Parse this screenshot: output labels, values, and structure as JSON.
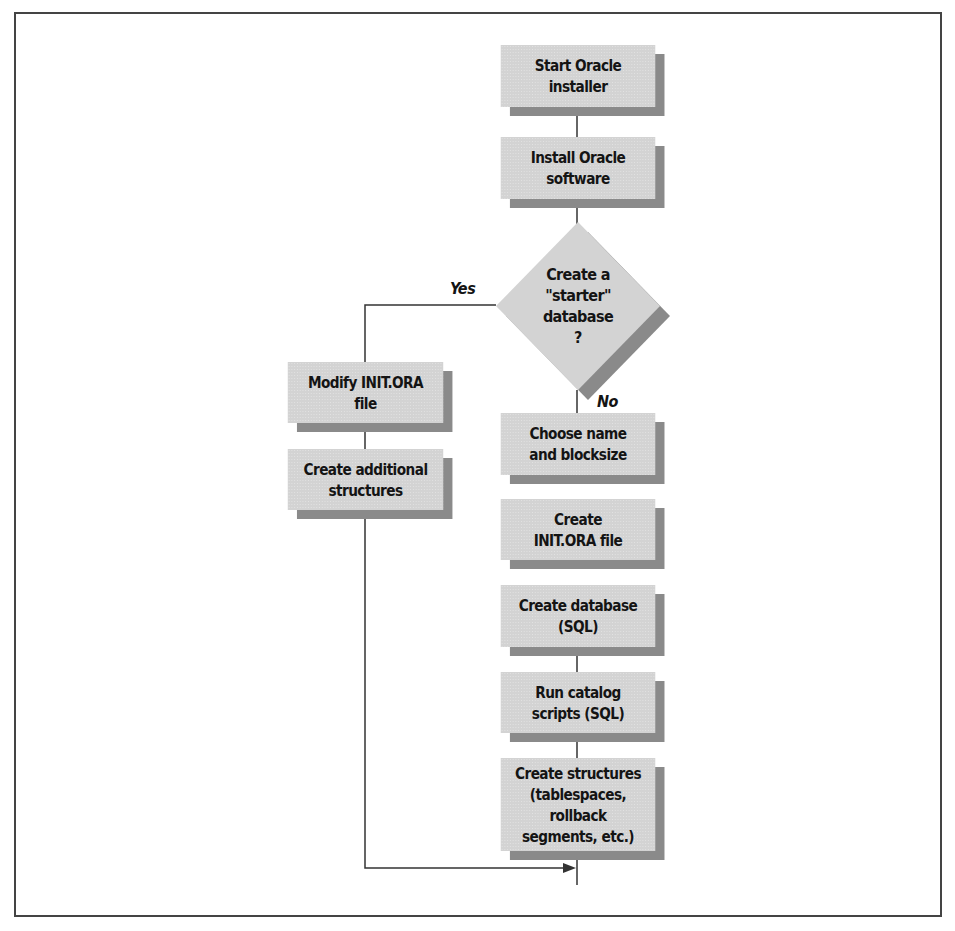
{
  "diagram": {
    "type": "flowchart",
    "nodes": [
      {
        "id": "start",
        "shape": "process",
        "label": "Start Oracle\ninstaller"
      },
      {
        "id": "install",
        "shape": "process",
        "label": "Install Oracle\nsoftware"
      },
      {
        "id": "decision",
        "shape": "decision",
        "label": "Create a\n\"starter\" database\n?"
      },
      {
        "id": "modify_init",
        "shape": "process",
        "label": "Modify INIT.ORA\nfile"
      },
      {
        "id": "create_additional",
        "shape": "process",
        "label": "Create additional\nstructures"
      },
      {
        "id": "choose_name",
        "shape": "process",
        "label": "Choose name\nand blocksize"
      },
      {
        "id": "create_init",
        "shape": "process",
        "label": "Create\nINIT.ORA file"
      },
      {
        "id": "create_db",
        "shape": "process",
        "label": "Create database\n(SQL)"
      },
      {
        "id": "run_catalog",
        "shape": "process",
        "label": "Run catalog\nscripts (SQL)"
      },
      {
        "id": "create_structures",
        "shape": "process",
        "label": "Create structures\n(tablespaces, rollback\nsegments, etc.)"
      }
    ],
    "edges": [
      {
        "from": "start",
        "to": "install"
      },
      {
        "from": "install",
        "to": "decision"
      },
      {
        "from": "decision",
        "to": "modify_init",
        "label": "Yes"
      },
      {
        "from": "modify_init",
        "to": "create_additional"
      },
      {
        "from": "create_additional",
        "to": "create_structures",
        "arrow": true
      },
      {
        "from": "decision",
        "to": "choose_name",
        "label": "No"
      },
      {
        "from": "choose_name",
        "to": "create_init"
      },
      {
        "from": "create_init",
        "to": "create_db"
      },
      {
        "from": "create_db",
        "to": "run_catalog"
      },
      {
        "from": "run_catalog",
        "to": "create_structures"
      }
    ],
    "edge_labels": {
      "yes": "Yes",
      "no": "No"
    },
    "colors": {
      "box_fill": "#d3d3d3",
      "box_shadow": "#8a8a8a",
      "line": "#333333",
      "border": "#444444"
    }
  }
}
